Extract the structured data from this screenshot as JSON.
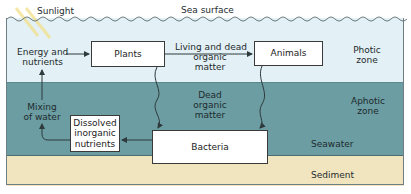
{
  "labels": {
    "sunlight": "Sunlight",
    "sea_surface": "Sea surface",
    "energy_nutrients": [
      "Energy and",
      "nutrients"
    ],
    "living_dead": [
      "Living and dead",
      "organic",
      "matter"
    ],
    "dead_organic": [
      "Dead",
      "organic",
      "matter"
    ],
    "mixing": [
      "Mixing",
      "of water"
    ],
    "photic_zone": [
      "Photic",
      "zone"
    ],
    "aphotic_zone": [
      "Aphotic",
      "zone"
    ],
    "seawater": "Seawater",
    "sediment": "Sediment"
  },
  "boxes": {
    "plants": "Plants",
    "animals": "Animals",
    "dissolved": [
      "Dissolved",
      "inorganic",
      "nutrients"
    ],
    "bacteria": "Bacteria"
  },
  "colors": {
    "photic": "#e3f0f5",
    "aphotic": "#6b9da2",
    "sediment": "#f0e5bf",
    "line": "#2e3a3c"
  }
}
